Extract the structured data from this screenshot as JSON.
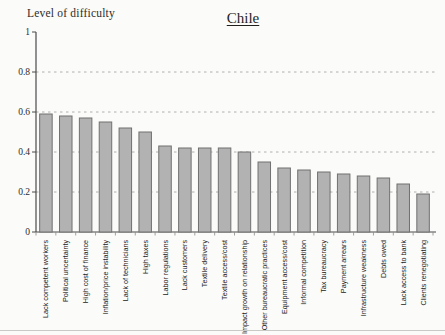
{
  "chart_data": {
    "type": "bar",
    "title": "Chile",
    "ylabel": "Level of difficulty",
    "xlabel": "",
    "ylim": [
      0,
      1
    ],
    "yticks": [
      0,
      0.2,
      0.4,
      0.6,
      0.8,
      1
    ],
    "grid": "horizontal dashed at 0.2 intervals",
    "legend": "none",
    "bar_fill_color": "#b2b2b2",
    "bar_border_color": "#707070",
    "axis_color": "#4a4a4a",
    "gridline_color": "#b0b0ae",
    "categories": [
      "Lack competent workers",
      "Political uncertainty",
      "High cost of finance",
      "Inflation/price instability",
      "Lack of technicians",
      "High taxes",
      "Labor regulations",
      "Lack customers",
      "Textile delivery",
      "Textile access/cost",
      "Impact growth on relationship",
      "Other bureaucratic practices",
      "Equipment access/cost",
      "Informal competition",
      "Tax bureaucracy",
      "Payment arrears",
      "Infrastructure weakness",
      "Debts owed",
      "Lack access to bank",
      "Clients renegotiating"
    ],
    "values": [
      0.59,
      0.58,
      0.57,
      0.55,
      0.52,
      0.5,
      0.43,
      0.42,
      0.42,
      0.42,
      0.4,
      0.35,
      0.32,
      0.31,
      0.3,
      0.29,
      0.28,
      0.27,
      0.24,
      0.19
    ]
  }
}
